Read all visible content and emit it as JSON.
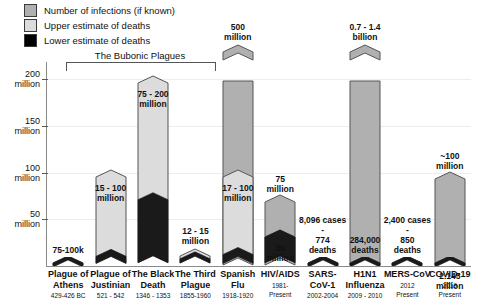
{
  "legend": {
    "items": [
      {
        "label": "Number of infections (if known)",
        "color": "#b0b0b0",
        "key": "infections"
      },
      {
        "label": "Upper estimate of deaths",
        "color": "#dcdcdc",
        "key": "upper"
      },
      {
        "label": "Lower estimate of deaths",
        "color": "#000000",
        "key": "lower"
      }
    ]
  },
  "annotation": {
    "bracket_label": "The Bubonic Plagues",
    "bracket_from": "Plague of Justinian",
    "bracket_to": "The Third Plague"
  },
  "chart_data": {
    "type": "bar",
    "title": "",
    "subtitle": "",
    "xlabel": "",
    "ylabel": "",
    "ylim": [
      0,
      215
    ],
    "grid": true,
    "legend_position": "top-left",
    "y_unit": "million",
    "yticks": [
      {
        "value": 50,
        "label": "50",
        "unit": "million"
      },
      {
        "value": 100,
        "label": "100",
        "unit": "million"
      },
      {
        "value": 150,
        "label": "150",
        "unit": "million"
      },
      {
        "value": 200,
        "label": "200",
        "unit": "million"
      }
    ],
    "categories": [
      "Plague of Athens",
      "Plague of Justinian",
      "The Black Death",
      "The Third Plague",
      "Spanish Flu",
      "HIV/AIDS",
      "SARS-CoV-1",
      "H1N1 Influenza",
      "MERS-CoV",
      "COVID-19"
    ],
    "series": [
      {
        "name": "Number of infections (if known)",
        "key": "infections",
        "values": [
          null,
          null,
          null,
          null,
          500,
          75,
          null,
          1400,
          null,
          100
        ]
      },
      {
        "name": "Upper estimate of deaths",
        "key": "upper",
        "values": [
          0.1,
          100,
          200,
          15,
          100,
          35,
          0.000774,
          0.284,
          0.00085,
          2.145
        ]
      },
      {
        "name": "Lower estimate of deaths",
        "key": "lower",
        "values": [
          0.075,
          15,
          75,
          12,
          17,
          35,
          0.000774,
          0.284,
          0.00085,
          2.145
        ]
      }
    ],
    "bars": [
      {
        "name": "Plague of Athens",
        "label_line1": "Plague of",
        "label_line2": "Athens",
        "dates": "429-426 BC",
        "value_text": "75-100k",
        "value_position": "above",
        "infections_text": null,
        "deaths_upper": 0.1,
        "deaths_lower": 0.075,
        "infections": null,
        "truncated": false
      },
      {
        "name": "Plague of Justinian",
        "label_line1": "Plague of",
        "label_line2": "Justinian",
        "dates": "521 - 542",
        "value_text": "15 - 100 million",
        "value_position": "inside",
        "infections_text": null,
        "deaths_upper": 100,
        "deaths_lower": 15,
        "infections": null,
        "truncated": false
      },
      {
        "name": "The Black Death",
        "label_line1": "The Black",
        "label_line2": "Death",
        "dates": "1346 - 1353",
        "value_text": "75 - 200 million",
        "value_position": "inside-top",
        "infections_text": null,
        "deaths_upper": 200,
        "deaths_lower": 75,
        "infections": null,
        "truncated": false
      },
      {
        "name": "The Third Plague",
        "label_line1": "The Third",
        "label_line2": "Plague",
        "dates": "1855-1960",
        "value_text": "12 - 15 million",
        "value_position": "above",
        "infections_text": null,
        "deaths_upper": 15,
        "deaths_lower": 12,
        "infections": null,
        "truncated": false
      },
      {
        "name": "Spanish Flu",
        "label_line1": "Spanish",
        "label_line2": "Flu",
        "dates": "1918-1920",
        "value_text": "17 - 100 million",
        "value_position": "inside",
        "infections_text": "500 million",
        "deaths_upper": 100,
        "deaths_lower": 17,
        "infections": 500,
        "truncated": true
      },
      {
        "name": "HIV/AIDS",
        "label_line1": "HIV/AIDS",
        "label_line2": "",
        "dates": "1981-Present",
        "value_text": "35 million",
        "value_position": "inside",
        "infections_text": "75 million",
        "deaths_upper": 35,
        "deaths_lower": 35,
        "infections": 75,
        "truncated": false
      },
      {
        "name": "SARS-CoV-1",
        "label_line1": "SARS-",
        "label_line2": "CoV-1",
        "dates": "2002-2004",
        "value_text": "8,096 cases - 774 deaths",
        "value_position": "above",
        "infections_text": null,
        "deaths_upper": 0.000774,
        "deaths_lower": 0.000774,
        "infections": 0.008096,
        "truncated": false
      },
      {
        "name": "H1N1 Influenza",
        "label_line1": "H1N1",
        "label_line2": "Influenza",
        "dates": "2009 - 2010",
        "value_text": "284,000 deaths",
        "value_position": "above",
        "infections_text": "0.7 - 1.4 billion",
        "deaths_upper": 0.284,
        "deaths_lower": 0.284,
        "infections": 1400,
        "truncated": true
      },
      {
        "name": "MERS-CoV",
        "label_line1": "MERS-CoV",
        "label_line2": "",
        "dates": "2012 - Present",
        "value_text": "2,400 cases - 850 deaths",
        "value_position": "above",
        "infections_text": null,
        "deaths_upper": 0.00085,
        "deaths_lower": 0.00085,
        "infections": 0.0024,
        "truncated": false
      },
      {
        "name": "COVID-19",
        "label_line1": "COVID-19",
        "label_line2": "",
        "dates": "2019 - Present",
        "value_text": "2.145 million",
        "value_position": "inside",
        "infections_text": "~100 million",
        "deaths_upper": 2.145,
        "deaths_lower": 2.145,
        "infections": 100,
        "truncated": false
      }
    ]
  },
  "colors": {
    "infections": "#b0b0b0",
    "upper": "#dcdcdc",
    "lower": "#1a1a1a",
    "outline": "#555555",
    "grid": "#ededed",
    "axis": "#8a8a8a"
  }
}
